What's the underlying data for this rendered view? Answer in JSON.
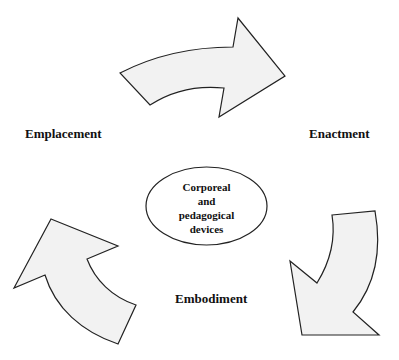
{
  "diagram": {
    "type": "cycle",
    "colors": {
      "arrow_fill": "#f2f2f2",
      "stroke": "#222222",
      "background": "#ffffff"
    },
    "center": {
      "lines": [
        "Corporeal",
        "and",
        "pedagogical",
        "devices"
      ]
    },
    "stages": [
      {
        "label": "Emplacement",
        "position": "left"
      },
      {
        "label": "Enactment",
        "position": "right"
      },
      {
        "label": "Embodiment",
        "position": "bottom"
      }
    ],
    "arrows": [
      {
        "from": "Emplacement",
        "to": "Enactment",
        "direction": "right"
      },
      {
        "from": "Enactment",
        "to": "Embodiment",
        "direction": "down-left"
      },
      {
        "from": "Embodiment",
        "to": "Emplacement",
        "direction": "up-left"
      }
    ]
  }
}
